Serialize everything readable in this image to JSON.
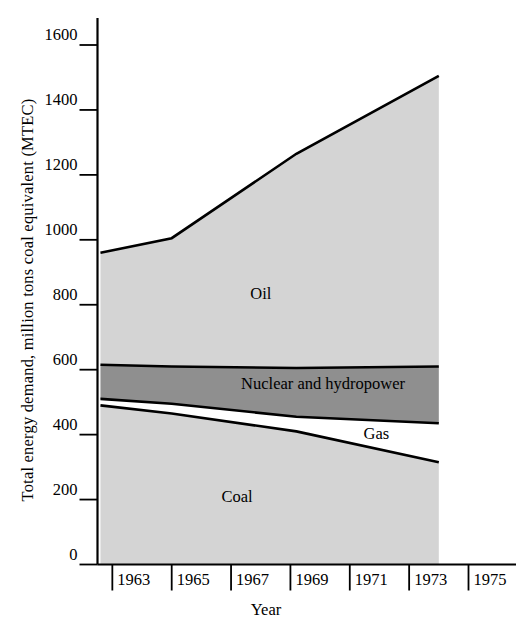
{
  "chart_data": {
    "type": "area",
    "title": "",
    "subtitle": "",
    "xlabel": "Year",
    "ylabel": "Total energy demand, million tons coal equivalent (MTEC)",
    "xlim": [
      1962.5,
      1975
    ],
    "ylim": [
      0,
      1600
    ],
    "yticks": [
      0,
      200,
      400,
      600,
      800,
      1000,
      1200,
      1400,
      1600
    ],
    "ytick_labels": [
      "0",
      "200",
      "400",
      "600",
      "800",
      "1000",
      "1200",
      "1400",
      "1600"
    ],
    "xticks": [
      1963,
      1965,
      1967,
      1969,
      1971,
      1973,
      1975
    ],
    "xtick_labels": [
      "1963",
      "1965",
      "1967",
      "1969",
      "1971",
      "1973",
      "1975"
    ],
    "grid": false,
    "legend_position": "inline-annotations",
    "stacked": true,
    "stack_order_bottom_to_top": [
      "Coal",
      "Gas",
      "Nuclear and hydropower",
      "Oil"
    ],
    "x": [
      1962.6,
      1965.0,
      1969.2,
      1974.0
    ],
    "series": [
      {
        "name": "Coal",
        "label": "Coal",
        "color": "#d4d4d4",
        "values": [
          490,
          465,
          410,
          315
        ],
        "cumulative_top": [
          490,
          465,
          410,
          315
        ]
      },
      {
        "name": "Gas",
        "label": "Gas",
        "color": "#ffffff",
        "values": [
          20,
          30,
          45,
          120
        ],
        "cumulative_top": [
          510,
          495,
          455,
          435
        ]
      },
      {
        "name": "Nuclear and hydropower",
        "label": "Nuclear and hydropower",
        "color": "#8f8f8f",
        "values": [
          105,
          115,
          150,
          175
        ],
        "cumulative_top": [
          615,
          610,
          605,
          610
        ]
      },
      {
        "name": "Oil",
        "label": "Oil",
        "color": "#d4d4d4",
        "values": [
          345,
          395,
          660,
          895
        ],
        "cumulative_top": [
          960,
          1005,
          1265,
          1505
        ]
      }
    ],
    "annotations": [
      {
        "text": "Oil",
        "x": 1968.0,
        "y": 830
      },
      {
        "text": "Nuclear and hydropower",
        "x": 1970.1,
        "y": 553
      },
      {
        "text": "Gas",
        "x": 1971.9,
        "y": 400
      },
      {
        "text": "Coal",
        "x": 1967.2,
        "y": 205
      }
    ]
  }
}
